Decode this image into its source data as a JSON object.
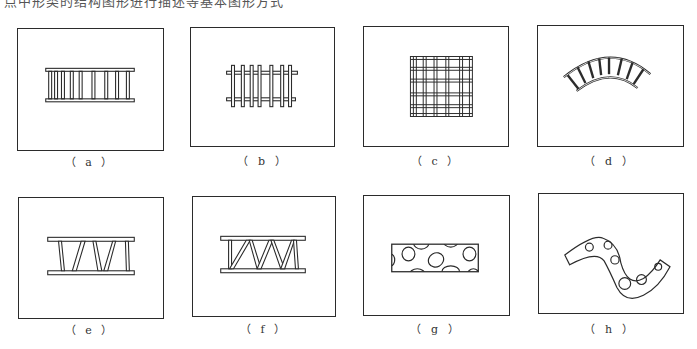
{
  "header": {
    "text": "点中形类的结构图形进行描述等基本图形方式"
  },
  "panels": [
    {
      "id": "a",
      "label": "（ a ）",
      "description": "straight ladder with vertical rungs"
    },
    {
      "id": "b",
      "label": "（ b ）",
      "description": "straight ladder with protruding rungs"
    },
    {
      "id": "c",
      "label": "（ c ）",
      "description": "square grid mesh"
    },
    {
      "id": "d",
      "label": "（ d ）",
      "description": "curved arc ladder"
    },
    {
      "id": "e",
      "label": "（ e ）",
      "description": "truss with slanted members"
    },
    {
      "id": "f",
      "label": "（ f ）",
      "description": "zigzag Warren truss"
    },
    {
      "id": "g",
      "label": "（ g ）",
      "description": "rectangular beam with elliptical holes"
    },
    {
      "id": "h",
      "label": "（ h ）",
      "description": "S-curved beam with circular holes"
    }
  ]
}
